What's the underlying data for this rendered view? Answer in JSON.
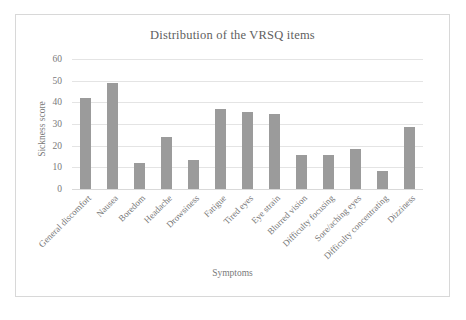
{
  "chart_data": {
    "type": "bar",
    "title": "Distribution of the VRSQ items",
    "xlabel": "Symptoms",
    "ylabel": "Sickness score",
    "ylim": [
      0,
      60
    ],
    "yticks": [
      0,
      10,
      20,
      30,
      40,
      50,
      60
    ],
    "grid": true,
    "legend": null,
    "bar_color": "#9b9b9b",
    "categories": [
      "General discomfort",
      "Nausea",
      "Boredom",
      "Headache",
      "Drowsiness",
      "Fatigue",
      "Tired eyes",
      "Eye strain",
      "Blurred vision",
      "Difficulty focusing",
      "Sore/aching eyes",
      "Difficulty concentrating",
      "Dizziness"
    ],
    "values": [
      42,
      49,
      12,
      24,
      13.5,
      37,
      35.5,
      34.5,
      15.5,
      15.5,
      18.5,
      8.5,
      28.5
    ]
  }
}
